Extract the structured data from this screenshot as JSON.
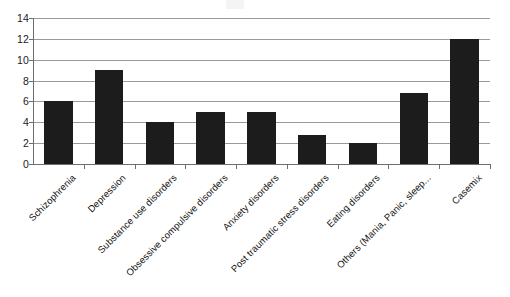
{
  "chart_data": {
    "type": "bar",
    "title": "",
    "subtitle": "",
    "xlabel": "",
    "ylabel": "",
    "ylim": [
      0,
      14
    ],
    "ytick_step": 2,
    "yticks": [
      "0",
      "2",
      "4",
      "6",
      "8",
      "10",
      "12",
      "14"
    ],
    "grid": true,
    "grid_axis": "y",
    "legend": false,
    "legend_position": "none",
    "bar_color": "#1c1c1c",
    "gridline_color": "#9a9a9a",
    "axis_color": "#6e6e6e",
    "background_color": "#ffffff",
    "label_rotation_degrees": -45,
    "categories": [
      "Schizophrenia",
      "Depression",
      "Substance use disorders",
      "Obsessive compulsive disorders",
      "Anxiety disorders",
      "Post traumatic stress disorders",
      "Eating disorders",
      "Others (Mania, Panic, sleep...",
      "Casemix"
    ],
    "values": [
      6,
      9,
      4,
      5,
      5,
      2.8,
      2,
      6.8,
      12
    ]
  }
}
